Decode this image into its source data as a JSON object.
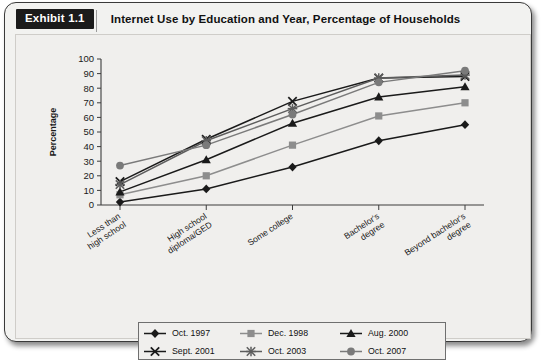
{
  "exhibit": {
    "tag": "Exhibit 1.1",
    "title": "Internet Use by Education and Year, Percentage of Households"
  },
  "chart_data": {
    "type": "line",
    "title": "Internet Use by Education and Year, Percentage of Households",
    "xlabel": "",
    "ylabel": "Percentage",
    "ylim": [
      0,
      100
    ],
    "ytick_step": 10,
    "yticks": [
      "100",
      "90",
      "80",
      "70",
      "60",
      "50",
      "40",
      "30",
      "20",
      "10",
      "0"
    ],
    "grid": false,
    "legend_position": "bottom",
    "categories": [
      "Less than high school",
      "High school diploma/GED",
      "Some college",
      "Bachelor's degree",
      "Beyond bachelor's degree"
    ],
    "series": [
      {
        "name": "Oct. 1997",
        "marker": "diamond",
        "color": "#1a1a1a",
        "values": [
          2,
          11,
          26,
          44,
          55
        ]
      },
      {
        "name": "Dec. 1998",
        "marker": "square",
        "color": "#8d8d8d",
        "values": [
          7,
          20,
          41,
          61,
          70
        ]
      },
      {
        "name": "Aug. 2000",
        "marker": "triangle",
        "color": "#1a1a1a",
        "values": [
          9,
          31,
          56,
          74,
          81
        ]
      },
      {
        "name": "Sept. 2001",
        "marker": "x",
        "color": "#1a1a1a",
        "values": [
          16,
          45,
          71,
          87,
          88
        ]
      },
      {
        "name": "Oct. 2003",
        "marker": "asterisk",
        "color": "#5d5d5d",
        "values": [
          14,
          44,
          66,
          87,
          89
        ]
      },
      {
        "name": "Oct. 2007",
        "marker": "circle",
        "color": "#7a7a7a",
        "values": [
          27,
          41,
          62,
          84,
          92
        ]
      }
    ]
  }
}
